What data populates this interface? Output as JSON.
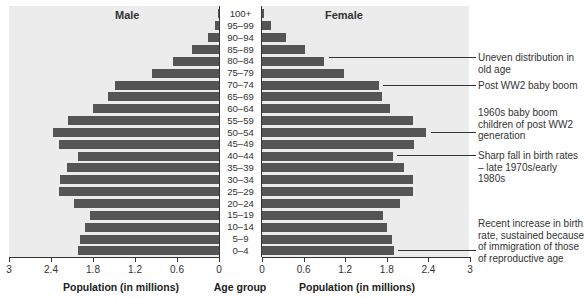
{
  "chart_data": {
    "type": "bar",
    "subtype": "population-pyramid",
    "title": "",
    "categories": [
      "100+",
      "95–99",
      "90–94",
      "85–89",
      "80–84",
      "75–79",
      "70–74",
      "65–69",
      "60–64",
      "55–59",
      "50–54",
      "45–49",
      "40–44",
      "35–39",
      "30–34",
      "25–29",
      "20–24",
      "15–19",
      "10–14",
      "5–9",
      "0–4"
    ],
    "series": [
      {
        "name": "Male",
        "values": [
          0.02,
          0.06,
          0.16,
          0.39,
          0.66,
          0.96,
          1.49,
          1.59,
          1.8,
          2.16,
          2.37,
          2.29,
          2.01,
          2.17,
          2.27,
          2.29,
          2.07,
          1.84,
          1.91,
          1.99,
          2.01
        ]
      },
      {
        "name": "Female",
        "values": [
          0.03,
          0.13,
          0.35,
          0.62,
          0.89,
          1.18,
          1.68,
          1.73,
          1.84,
          2.17,
          2.36,
          2.19,
          1.88,
          2.04,
          2.17,
          2.17,
          1.99,
          1.74,
          1.8,
          1.87,
          1.9
        ]
      }
    ],
    "xlabel_left": "Population (in millions)",
    "xlabel_center": "Age group",
    "xlabel_right": "Population (in millions)",
    "male_ticks": [
      "3",
      "2.4",
      "1.8",
      "1.2",
      "0.6",
      "0"
    ],
    "female_ticks": [
      "0",
      "0.6",
      "1.2",
      "1.8",
      "2.4",
      "3"
    ],
    "xlim": [
      0,
      3
    ],
    "grid": false,
    "annotations": [
      {
        "text": "Uneven distribution in old age",
        "age_group": "80–84"
      },
      {
        "text": "Post WW2 baby boom",
        "age_group": "70–74"
      },
      {
        "text": "1960s baby boom children of post WW2 generation",
        "age_group": "50–54"
      },
      {
        "text": "Sharp fall in birth rates – late 1970s/early 1980s",
        "age_group": "40–44"
      },
      {
        "text": "Recent increase in birth rate, sustained because of immigration of those of reproductive age",
        "age_group": "0–4"
      }
    ],
    "colors": {
      "bar": "#555555",
      "panel": "#ececec",
      "age_column": "#ffffff"
    }
  },
  "labels": {
    "male_title": "Male",
    "female_title": "Female"
  }
}
